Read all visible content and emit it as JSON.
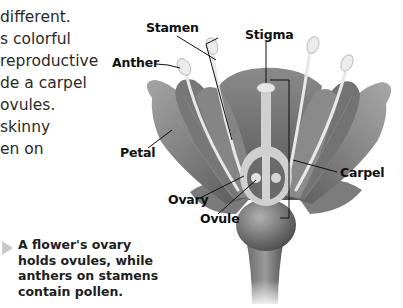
{
  "body_text": {
    "lines": [
      "different.",
      "s colorful",
      "reproductive",
      "de a carpel",
      "ovules.",
      "skinny",
      "en on"
    ]
  },
  "diagram": {
    "labels": {
      "stamen": "Stamen",
      "stigma": "Stigma",
      "anther": "Anther",
      "petal": "Petal",
      "carpel": "Carpel",
      "ovary": "Ovary",
      "ovule": "Ovule"
    },
    "icons": [
      "flower-illustration",
      "caption-pointer-triangle"
    ]
  },
  "caption": {
    "text": "A flower's ovary holds ovules, while anthers on stamens contain pollen."
  },
  "colors": {
    "petal_dark": "#6e6e6e",
    "petal_light": "#a8a8a8",
    "stamen_filament": "#e6e6e6",
    "pointer_triangle": "#c8c8c8",
    "label_text": "#111111"
  }
}
